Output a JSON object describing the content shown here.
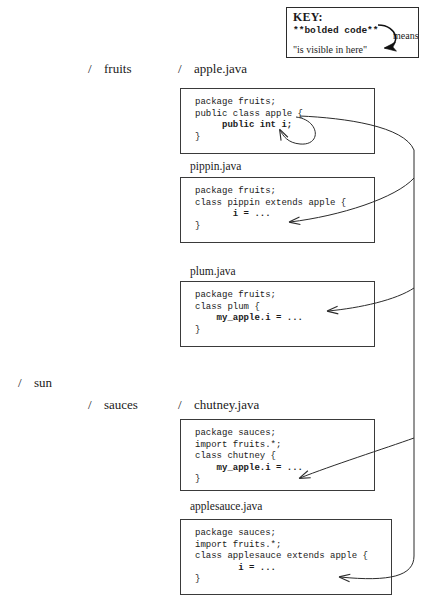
{
  "key": {
    "title": "KEY:",
    "bolded_code": "**bolded code**",
    "visible_text": "\"is visible in here\"",
    "means_label": "means"
  },
  "tree": {
    "dirs": [
      {
        "name": "fruits",
        "slash": "/"
      },
      {
        "name": "sun",
        "slash": "/"
      },
      {
        "name": "sauces",
        "slash": "/"
      }
    ],
    "file_headers": [
      {
        "name": "apple.java",
        "slash": "/"
      },
      {
        "name": "chutney.java",
        "slash": "/"
      }
    ],
    "file_labels": [
      {
        "name": "pippin.java"
      },
      {
        "name": "plum.java"
      },
      {
        "name": "applesauce.java"
      }
    ]
  },
  "code_blocks": [
    {
      "file": "apple.java",
      "lines": [
        {
          "text": "package fruits;",
          "bold": false
        },
        {
          "text": "public class apple {",
          "bold": false
        },
        {
          "text": "     public int i;",
          "bold": true
        },
        {
          "text": "}",
          "bold": false
        }
      ]
    },
    {
      "file": "pippin.java",
      "lines": [
        {
          "text": "package fruits;",
          "bold": false
        },
        {
          "text": "class pippin extends apple {",
          "bold": false
        },
        {
          "text": "       i = ...",
          "bold": true
        },
        {
          "text": "}",
          "bold": false
        }
      ]
    },
    {
      "file": "plum.java",
      "lines": [
        {
          "text": "package fruits;",
          "bold": false
        },
        {
          "text": "class plum {",
          "bold": false
        },
        {
          "text": "    my_apple.i = ...",
          "bold": true
        },
        {
          "text": "}",
          "bold": false
        }
      ]
    },
    {
      "file": "chutney.java",
      "lines": [
        {
          "text": "package sauces;",
          "bold": false
        },
        {
          "text": "import fruits.*;",
          "bold": false
        },
        {
          "text": "class chutney {",
          "bold": false
        },
        {
          "text": "    my_apple.i = ...",
          "bold": true
        },
        {
          "text": "}",
          "bold": false
        }
      ]
    },
    {
      "file": "applesauce.java",
      "lines": [
        {
          "text": "package sauces;",
          "bold": false
        },
        {
          "text": "import fruits.*;",
          "bold": false
        },
        {
          "text": "class applesauce extends apple {",
          "bold": false
        },
        {
          "text": "        i = ...",
          "bold": true
        },
        {
          "text": "}",
          "bold": false
        }
      ]
    }
  ],
  "colors": {
    "ink": "#1a1a1a",
    "border": "#3a3a3a",
    "background": "#ffffff"
  }
}
